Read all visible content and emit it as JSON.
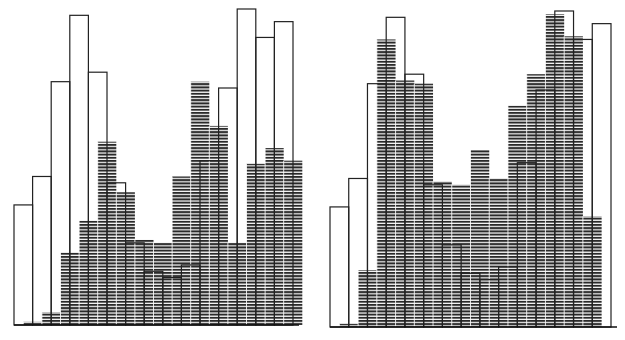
{
  "chart_data": [
    {
      "type": "bar",
      "title": "",
      "xlabel": "",
      "ylabel": "",
      "grid": false,
      "legend": null,
      "ylim": [
        0,
        100
      ],
      "bins": 15,
      "layout": {
        "baseline_y": 325,
        "x0": 14,
        "x1": 293,
        "px_per_unit": 3.16
      },
      "series": [
        {
          "name": "outline",
          "style": "open-rectangles",
          "values": [
            38,
            47,
            77,
            98,
            80,
            45,
            26,
            17,
            15,
            19,
            52,
            75,
            100,
            91,
            96
          ]
        },
        {
          "name": "hatched",
          "style": "horizontal-hatch",
          "offset_bins": 0.5,
          "values": [
            1,
            4,
            23,
            33,
            58,
            42,
            27,
            26,
            47,
            77,
            63,
            26,
            51,
            56,
            52
          ]
        }
      ]
    },
    {
      "type": "bar",
      "title": "",
      "xlabel": "",
      "ylabel": "",
      "grid": false,
      "legend": null,
      "ylim": [
        0,
        100
      ],
      "bins": 15,
      "layout": {
        "baseline_y": 327,
        "x0": 330,
        "x1": 611,
        "px_per_unit": 3.16
      },
      "series": [
        {
          "name": "outline",
          "style": "open-rectangles",
          "values": [
            38,
            47,
            77,
            98,
            80,
            45,
            26,
            17,
            15,
            19,
            52,
            75,
            100,
            91,
            96
          ]
        },
        {
          "name": "hatched",
          "style": "horizontal-hatch",
          "offset_bins": 0.5,
          "values": [
            1,
            18,
            91,
            78,
            77,
            46,
            45,
            56,
            47,
            70,
            80,
            99,
            92,
            35,
            0
          ]
        }
      ]
    }
  ]
}
